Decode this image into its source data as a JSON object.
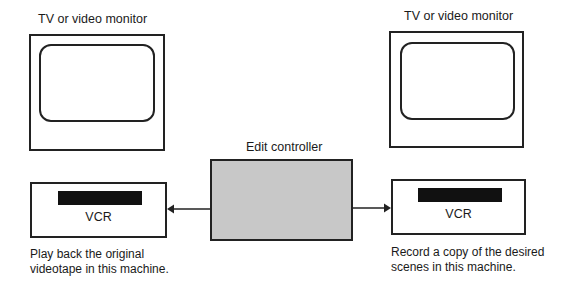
{
  "diagram": {
    "left_monitor": {
      "label": "TV or video monitor"
    },
    "right_monitor": {
      "label": "TV or video monitor"
    },
    "controller": {
      "label": "Edit controller",
      "fill_color": "#c8c8c8"
    },
    "left_vcr": {
      "label": "VCR",
      "caption_line1": "Play back the original",
      "caption_line2": "videotape in this machine."
    },
    "right_vcr": {
      "label": "VCR",
      "caption_line1": "Record a copy of the desired",
      "caption_line2": "scenes in this machine."
    },
    "connections": [
      {
        "from": "controller",
        "to": "left_vcr",
        "arrow": "left"
      },
      {
        "from": "controller",
        "to": "right_vcr",
        "arrow": "right"
      }
    ]
  }
}
